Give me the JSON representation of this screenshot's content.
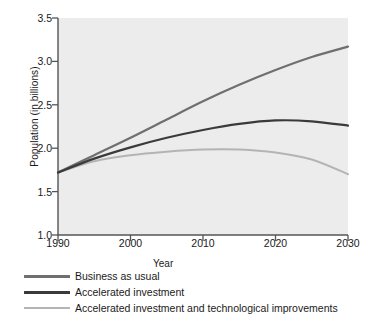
{
  "chart_data": {
    "type": "line",
    "title": "",
    "xlabel": "Year",
    "ylabel": "Population (in billions)",
    "xlim": [
      1990,
      2030
    ],
    "ylim": [
      1.0,
      3.5
    ],
    "xticks": [
      1990,
      2000,
      2010,
      2020,
      2030
    ],
    "xtick_labels": [
      "1990",
      "2000",
      "2010",
      "2020",
      "2030"
    ],
    "yticks": [
      1.0,
      1.5,
      2.0,
      2.5,
      3.0,
      3.5
    ],
    "ytick_labels": [
      "1.0",
      "1.5",
      "2.0",
      "2.5",
      "3.0",
      "3.5"
    ],
    "grid": false,
    "legend_position": "below-plot-left",
    "plot_background": "#ececec",
    "x": [
      1990,
      1995,
      2000,
      2005,
      2010,
      2015,
      2020,
      2025,
      2030
    ],
    "series": [
      {
        "name": "Business as usual",
        "color": "#6f6f6f",
        "values": [
          1.72,
          1.92,
          2.12,
          2.33,
          2.54,
          2.73,
          2.9,
          3.05,
          3.17
        ]
      },
      {
        "name": "Accelerated investment",
        "color": "#3a3a3a",
        "values": [
          1.72,
          1.88,
          2.01,
          2.12,
          2.21,
          2.28,
          2.32,
          2.31,
          2.26
        ]
      },
      {
        "name": "Accelerated investment and technological improvements",
        "color": "#b4b4b4",
        "values": [
          1.72,
          1.85,
          1.92,
          1.96,
          1.985,
          1.985,
          1.95,
          1.87,
          1.7
        ]
      }
    ]
  }
}
